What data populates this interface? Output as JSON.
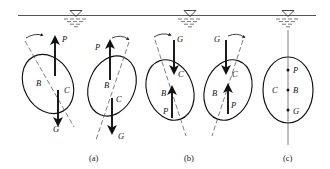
{
  "figure": {
    "background": "#ffffff",
    "ink_color": "#111111",
    "water_line_color": "#555555"
  },
  "water_surface": {
    "name": "water-surface-line",
    "x_start": 18,
    "x_end": 316,
    "y": 15,
    "symbols": [
      {
        "label": "water-level-symbol",
        "x": 76
      },
      {
        "label": "water-level-symbol",
        "x": 190
      },
      {
        "label": "water-level-symbol",
        "x": 288
      }
    ]
  },
  "captions": [
    {
      "text": "(a)",
      "x": 95,
      "y": 160
    },
    {
      "text": "(b)",
      "x": 190,
      "y": 160
    },
    {
      "text": "(c)",
      "x": 288,
      "y": 160
    }
  ],
  "force_labels": {
    "buoyancy": "P",
    "center_of_buoyancy": "B",
    "center_of_gravity_point": "C",
    "weight": "G"
  },
  "panels": [
    {
      "id": "a1",
      "caption_group": "(a)",
      "tilt_deg": -28,
      "center": {
        "x": 48,
        "y": 84
      },
      "rx": 24,
      "ry": 31,
      "axis": "dashed-tilted",
      "rotation_arrow": "counterclockwise",
      "rotation_arrow_side": "top-left",
      "state": "restoring couple",
      "labels": [
        {
          "text": "P",
          "x": 62,
          "y": 42
        },
        {
          "text": "B",
          "x": 38,
          "y": 85
        },
        {
          "text": "C",
          "x": 66,
          "y": 93
        },
        {
          "text": "G",
          "x": 56,
          "y": 129
        }
      ],
      "arrows": [
        {
          "name": "buoyancy-arrow",
          "label": "P",
          "direction": "up",
          "x": 55,
          "y_tail": 76,
          "y_head": 40
        },
        {
          "name": "weight-arrow",
          "label": "G",
          "direction": "down",
          "x": 58,
          "y_tail": 90,
          "y_head": 122
        }
      ]
    },
    {
      "id": "a2",
      "caption_group": "(a)",
      "tilt_deg": 22,
      "center": {
        "x": 112,
        "y": 84
      },
      "rx": 23,
      "ry": 31,
      "axis": "dashed-tilted",
      "rotation_arrow": "clockwise",
      "rotation_arrow_side": "top-right",
      "state": "restoring couple",
      "labels": [
        {
          "text": "P",
          "x": 97,
          "y": 48
        },
        {
          "text": "B",
          "x": 107,
          "y": 86
        },
        {
          "text": "C",
          "x": 118,
          "y": 101
        },
        {
          "text": "G",
          "x": 120,
          "y": 136
        }
      ],
      "arrows": [
        {
          "name": "buoyancy-arrow",
          "label": "P",
          "direction": "up",
          "x": 110,
          "y_tail": 80,
          "y_head": 44
        },
        {
          "name": "weight-arrow",
          "label": "G",
          "direction": "down",
          "x": 112,
          "y_tail": 98,
          "y_head": 130
        }
      ]
    },
    {
      "id": "b1",
      "caption_group": "(b)",
      "tilt_deg": -22,
      "center": {
        "x": 172,
        "y": 88
      },
      "rx": 23,
      "ry": 31,
      "axis": "dashed-tilted",
      "rotation_arrow": "counterclockwise",
      "rotation_arrow_side": "top-left",
      "state": "overturning couple",
      "labels": [
        {
          "text": "G",
          "x": 178,
          "y": 42
        },
        {
          "text": "C",
          "x": 184,
          "y": 73
        },
        {
          "text": "B",
          "x": 163,
          "y": 95
        },
        {
          "text": "P",
          "x": 163,
          "y": 112
        }
      ],
      "arrows": [
        {
          "name": "weight-arrow",
          "label": "G",
          "direction": "down",
          "x": 174,
          "y_tail": 40,
          "y_head": 70
        },
        {
          "name": "buoyancy-arrow",
          "label": "P",
          "direction": "up",
          "x": 172,
          "y_tail": 118,
          "y_head": 90
        }
      ]
    },
    {
      "id": "b2",
      "caption_group": "(b)",
      "tilt_deg": 20,
      "center": {
        "x": 230,
        "y": 88
      },
      "rx": 23,
      "ry": 31,
      "axis": "dashed-tilted",
      "rotation_arrow": "clockwise",
      "rotation_arrow_side": "top-right",
      "state": "overturning couple",
      "labels": [
        {
          "text": "G",
          "x": 215,
          "y": 42
        },
        {
          "text": "C",
          "x": 237,
          "y": 73
        },
        {
          "text": "B",
          "x": 214,
          "y": 95
        },
        {
          "text": "P",
          "x": 233,
          "y": 106
        }
      ],
      "arrows": [
        {
          "name": "weight-arrow",
          "label": "G",
          "direction": "down",
          "x": 226,
          "y_tail": 40,
          "y_head": 70
        },
        {
          "name": "buoyancy-arrow",
          "label": "P",
          "direction": "up",
          "x": 228,
          "y_tail": 114,
          "y_head": 88
        }
      ]
    },
    {
      "id": "c1",
      "caption_group": "(c)",
      "tilt_deg": 0,
      "center": {
        "x": 288,
        "y": 88
      },
      "rx": 25,
      "ry": 33,
      "axis": "solid-vertical",
      "rotation_arrow": "none",
      "state": "equilibrium",
      "labels": [
        {
          "text": "P",
          "x": 295,
          "y": 71
        },
        {
          "text": "C",
          "x": 272,
          "y": 90
        },
        {
          "text": "B",
          "x": 295,
          "y": 90
        },
        {
          "text": "G",
          "x": 295,
          "y": 111
        }
      ],
      "points": [
        {
          "name": "point-P",
          "x": 288,
          "y": 68
        },
        {
          "name": "point-B",
          "x": 288,
          "y": 88
        },
        {
          "name": "point-G",
          "x": 288,
          "y": 108
        }
      ]
    }
  ]
}
